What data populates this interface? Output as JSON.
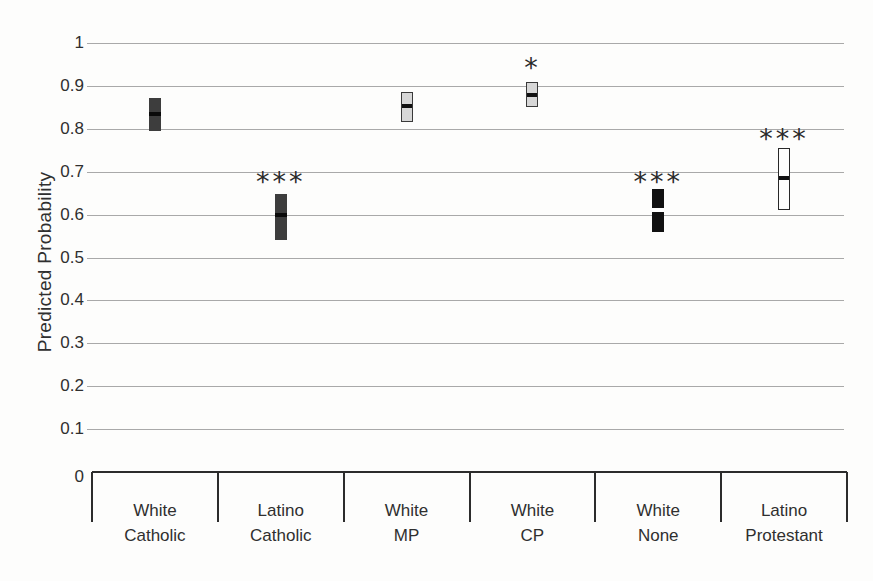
{
  "chart_data": {
    "type": "box-range",
    "title": "",
    "xlabel": "",
    "ylabel": "Predicted Probability",
    "grid": true,
    "legend": "none",
    "y_axis": {
      "title": "Predicted Probability",
      "range": [
        0,
        1
      ],
      "tick_values": [
        1,
        0.9,
        0.8,
        0.7,
        0.6,
        0.5,
        0.4,
        0.3,
        0.2,
        0.1,
        0
      ],
      "tick_labels": [
        "1",
        "0.9",
        "0.8",
        "0.7",
        "0.6",
        "0.5",
        "0.4",
        "0.3",
        "0.2",
        "0.1",
        "0"
      ]
    },
    "categories": [
      "White Catholic",
      "Latino Catholic",
      "White MP",
      "White CP",
      "White None",
      "Latino Protestant"
    ],
    "series": [
      {
        "name": "White Catholic",
        "label_lines": [
          "White",
          "Catholic"
        ],
        "low": 0.795,
        "high": 0.872,
        "point": 0.835,
        "fill_style": "dark-gray",
        "significance": "",
        "sig_y": null
      },
      {
        "name": "Latino Catholic",
        "label_lines": [
          "Latino",
          "Catholic"
        ],
        "low": 0.54,
        "high": 0.648,
        "point": 0.6,
        "fill_style": "dark-gray",
        "significance": "***",
        "sig_y": 0.69
      },
      {
        "name": "White MP",
        "label_lines": [
          "White",
          "MP"
        ],
        "low": 0.815,
        "high": 0.885,
        "point": 0.852,
        "fill_style": "light-gray",
        "significance": "",
        "sig_y": null
      },
      {
        "name": "White CP",
        "label_lines": [
          "White",
          "CP"
        ],
        "low": 0.85,
        "high": 0.91,
        "point": 0.878,
        "fill_style": "light-gray",
        "significance": "*",
        "sig_y": 0.955
      },
      {
        "name": "White None",
        "label_lines": [
          "White",
          "None"
        ],
        "low": 0.56,
        "high": 0.66,
        "point": 0.61,
        "fill_style": "black",
        "significance": "***",
        "sig_y": 0.69
      },
      {
        "name": "Latino Protestant",
        "label_lines": [
          "Latino",
          "Protestant"
        ],
        "low": 0.61,
        "high": 0.755,
        "point": 0.685,
        "fill_style": "white",
        "significance": "***",
        "sig_y": 0.79
      }
    ],
    "styles": {
      "dark-gray": {
        "fill": "#3d3d3d",
        "border": "none",
        "median": "#0a0a0a"
      },
      "light-gray": {
        "fill": "#d7d7d7",
        "border": "#3a3a3a",
        "median": "#111111"
      },
      "black": {
        "fill": "#111111",
        "border": "none",
        "median": "#ffffff"
      },
      "white": {
        "fill": "#fdfdfc",
        "border": "#282828",
        "median": "#111111"
      }
    },
    "colors": {
      "gridline": "#a9a9a9",
      "axis": "#2c2c2c",
      "text": "#2f2f2f",
      "background": "#fdfdfc"
    }
  }
}
